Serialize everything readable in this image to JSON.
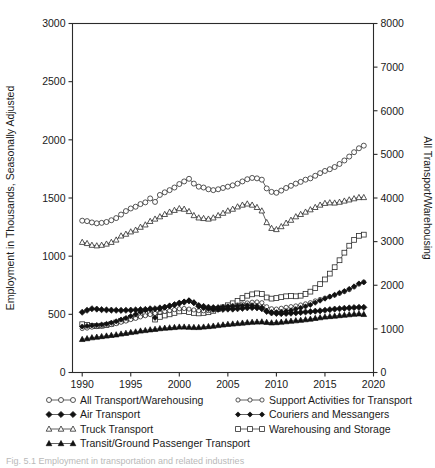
{
  "figure": {
    "caption": "Fig. 5.1  Employment in transportation and related industries",
    "background": "#ffffff",
    "line_color": "#3a3a3a"
  },
  "chart_data": {
    "type": "line",
    "title": "",
    "xlabel": "",
    "ylabel": "Employment in Thousands, Seasonally Adjusted",
    "y2label": "All Transport/Warehousing",
    "xlim": [
      1989,
      2020
    ],
    "ylim": [
      0,
      3000
    ],
    "y2lim": [
      0,
      8000
    ],
    "xticks": [
      1990,
      1995,
      2000,
      2005,
      2010,
      2015,
      2020
    ],
    "yticks": [
      0,
      500,
      1000,
      1500,
      2000,
      2500,
      3000
    ],
    "y2ticks": [
      0,
      1000,
      2000,
      3000,
      4000,
      5000,
      6000,
      7000,
      8000
    ],
    "grid": false,
    "legend_position": "below",
    "x": [
      1990.0,
      1990.5,
      1991.0,
      1991.5,
      1992.0,
      1992.5,
      1993.0,
      1993.5,
      1994.0,
      1994.5,
      1995.0,
      1995.5,
      1996.0,
      1996.5,
      1997.0,
      1997.5,
      1998.0,
      1998.5,
      1999.0,
      1999.5,
      2000.0,
      2000.5,
      2001.0,
      2001.5,
      2002.0,
      2002.5,
      2003.0,
      2003.5,
      2004.0,
      2004.5,
      2005.0,
      2005.5,
      2006.0,
      2006.5,
      2007.0,
      2007.5,
      2008.0,
      2008.5,
      2009.0,
      2009.5,
      2010.0,
      2010.5,
      2011.0,
      2011.5,
      2012.0,
      2012.5,
      2013.0,
      2013.5,
      2014.0,
      2014.5,
      2015.0,
      2015.5,
      2016.0,
      2016.5,
      2017.0,
      2017.5,
      2018.0,
      2018.5,
      2019.0
    ],
    "series": [
      {
        "name": "All Transport/Warehousing",
        "marker": "circle-open",
        "axis": "right",
        "axis_units": "All Transport/Warehousing (thousands)",
        "values": [
          3480,
          3470,
          3440,
          3420,
          3430,
          3450,
          3490,
          3540,
          3620,
          3700,
          3760,
          3800,
          3860,
          3900,
          3990,
          3910,
          4070,
          4130,
          4180,
          4240,
          4320,
          4380,
          4440,
          4330,
          4260,
          4240,
          4200,
          4180,
          4200,
          4230,
          4260,
          4290,
          4330,
          4380,
          4430,
          4460,
          4450,
          4420,
          4220,
          4140,
          4120,
          4170,
          4230,
          4280,
          4330,
          4370,
          4420,
          4450,
          4510,
          4570,
          4620,
          4660,
          4710,
          4780,
          4860,
          4950,
          5050,
          5140,
          5200
        ]
      },
      {
        "name": "Truck Transport",
        "marker": "triangle-open",
        "axis": "left",
        "values": [
          1120,
          1110,
          1095,
          1090,
          1095,
          1105,
          1120,
          1140,
          1175,
          1190,
          1210,
          1225,
          1250,
          1270,
          1300,
          1320,
          1340,
          1360,
          1380,
          1395,
          1410,
          1405,
          1385,
          1350,
          1330,
          1325,
          1320,
          1330,
          1350,
          1370,
          1390,
          1405,
          1425,
          1440,
          1450,
          1440,
          1420,
          1390,
          1290,
          1240,
          1230,
          1255,
          1285,
          1310,
          1340,
          1360,
          1380,
          1400,
          1420,
          1440,
          1455,
          1460,
          1458,
          1465,
          1475,
          1485,
          1495,
          1505,
          1505
        ]
      },
      {
        "name": "Warehousing and Storage",
        "marker": "square-open",
        "axis": "left",
        "values": [
          415,
          410,
          400,
          398,
          402,
          408,
          418,
          430,
          445,
          455,
          470,
          480,
          495,
          505,
          518,
          455,
          478,
          490,
          500,
          512,
          525,
          528,
          520,
          512,
          508,
          512,
          518,
          530,
          545,
          560,
          578,
          595,
          615,
          640,
          660,
          672,
          680,
          675,
          645,
          635,
          640,
          648,
          655,
          658,
          655,
          660,
          675,
          695,
          725,
          760,
          800,
          850,
          905,
          965,
          1030,
          1090,
          1140,
          1175,
          1185
        ]
      },
      {
        "name": "Support Activities for Transport",
        "marker": "circle-open-small",
        "axis": "left",
        "values": [
          378,
          382,
          390,
          395,
          400,
          405,
          412,
          420,
          432,
          442,
          455,
          465,
          478,
          488,
          498,
          508,
          518,
          525,
          532,
          540,
          548,
          550,
          545,
          538,
          532,
          530,
          532,
          538,
          548,
          556,
          565,
          572,
          580,
          590,
          598,
          604,
          606,
          600,
          565,
          548,
          545,
          552,
          560,
          566,
          572,
          580,
          590,
          600,
          615,
          628,
          640,
          652,
          665,
          680,
          695,
          712,
          735,
          760,
          778
        ]
      },
      {
        "name": "Air Transport",
        "marker": "diamond-filled",
        "axis": "left",
        "values": [
          518,
          535,
          548,
          545,
          540,
          538,
          536,
          535,
          534,
          535,
          536,
          538,
          540,
          542,
          548,
          548,
          555,
          562,
          572,
          582,
          595,
          605,
          615,
          600,
          570,
          558,
          550,
          545,
          543,
          543,
          545,
          545,
          548,
          552,
          556,
          558,
          556,
          548,
          525,
          512,
          508,
          506,
          508,
          510,
          513,
          516,
          520,
          523,
          527,
          530,
          535,
          540,
          545,
          548,
          552,
          555,
          558,
          560,
          560
        ]
      },
      {
        "name": "Couriers and Messangers",
        "marker": "diamond-filled-small",
        "axis": "left",
        "values": [
          395,
          400,
          405,
          408,
          412,
          418,
          428,
          440,
          455,
          468,
          485,
          500,
          520,
          535,
          545,
          470,
          545,
          558,
          572,
          585,
          600,
          610,
          620,
          600,
          580,
          572,
          565,
          562,
          562,
          565,
          568,
          570,
          572,
          575,
          578,
          578,
          572,
          560,
          528,
          518,
          518,
          522,
          528,
          535,
          545,
          555,
          568,
          582,
          600,
          618,
          635,
          652,
          668,
          685,
          700,
          718,
          740,
          765,
          775
        ]
      },
      {
        "name": "Transit/Ground Passenger Transport",
        "marker": "triangle-filled",
        "axis": "left",
        "values": [
          285,
          292,
          300,
          305,
          310,
          315,
          320,
          325,
          332,
          338,
          345,
          350,
          358,
          362,
          368,
          372,
          378,
          382,
          385,
          388,
          392,
          392,
          390,
          388,
          388,
          392,
          396,
          400,
          405,
          410,
          415,
          418,
          422,
          426,
          430,
          433,
          435,
          436,
          432,
          428,
          430,
          434,
          438,
          442,
          446,
          450,
          455,
          460,
          466,
          472,
          478,
          482,
          486,
          490,
          494,
          498,
          502,
          505,
          500
        ]
      }
    ]
  },
  "legend": {
    "entries": [
      {
        "label": "All Transport/Warehousing",
        "marker": "circle-open",
        "column": 1
      },
      {
        "label": "Air Transport",
        "marker": "diamond-filled",
        "column": 1
      },
      {
        "label": "Truck Transport",
        "marker": "triangle-open",
        "column": 1
      },
      {
        "label": "Transit/Ground Passenger Transport",
        "marker": "triangle-filled",
        "column": 1
      },
      {
        "label": "Support Activities for Transport",
        "marker": "circle-open-small",
        "column": 2
      },
      {
        "label": "Couriers and Messangers",
        "marker": "diamond-filled-small",
        "column": 2
      },
      {
        "label": "Warehousing and Storage",
        "marker": "square-open",
        "column": 2
      }
    ]
  }
}
